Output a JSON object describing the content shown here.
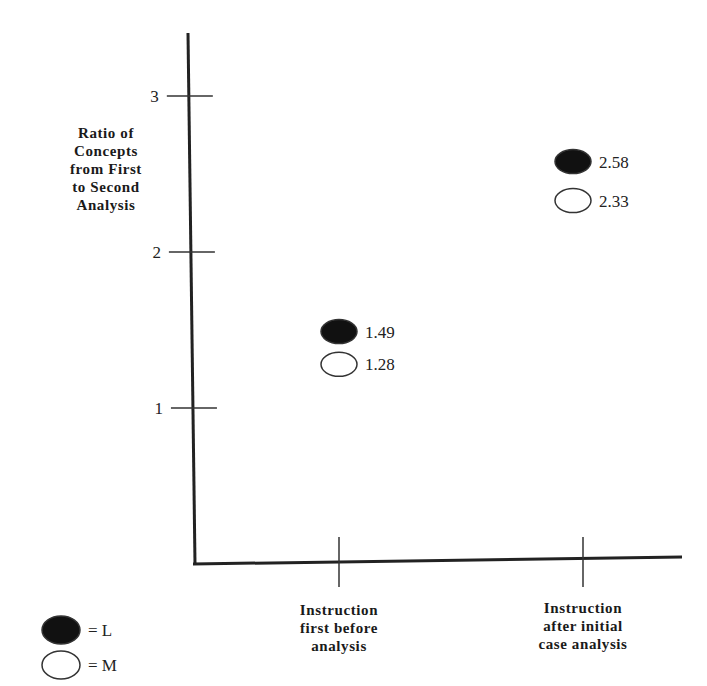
{
  "chart_data": {
    "type": "scatter",
    "title": "",
    "ylabel": "Ratio of Concepts from First to Second Analysis",
    "ylabel_lines": [
      "Ratio of",
      "Concepts",
      "from First",
      "to Second",
      "Analysis"
    ],
    "xlabel": "",
    "categories": [
      "Instruction first before analysis",
      "Instruction after initial case analysis"
    ],
    "category_lines": [
      [
        "Instruction",
        "first before",
        "analysis"
      ],
      [
        "Instruction",
        "after initial",
        "case analysis"
      ]
    ],
    "y_ticks": [
      1,
      2,
      3
    ],
    "ylim": [
      0,
      3.4
    ],
    "grid": false,
    "series": [
      {
        "name": "L",
        "marker": "filled-ellipse",
        "color": "#111111",
        "values": [
          1.49,
          2.58
        ],
        "labels": [
          "1.49",
          "2.58"
        ]
      },
      {
        "name": "M",
        "marker": "open-ellipse",
        "color": "#ffffff",
        "values": [
          1.28,
          2.33
        ],
        "labels": [
          "1.28",
          "2.33"
        ]
      }
    ],
    "legend": {
      "position": "bottom-left",
      "entries": [
        {
          "symbol": "filled",
          "label": "= L"
        },
        {
          "symbol": "open",
          "label": "= M"
        }
      ]
    }
  }
}
